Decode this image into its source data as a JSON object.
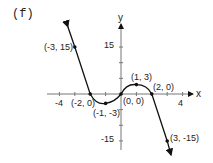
{
  "panel_label": "(f)",
  "chart_data": {
    "type": "line",
    "title": "(f)",
    "xlabel": "x",
    "ylabel": "y",
    "xlim": [
      -4.5,
      5
    ],
    "ylim": [
      -17,
      22
    ],
    "x_ticks": [
      -4,
      -3,
      -2,
      -1,
      0,
      1,
      2,
      3,
      4
    ],
    "x_tick_labels": {
      "-4": "-4",
      "4": "4"
    },
    "y_ticks": [
      -15,
      -10,
      -5,
      0,
      5,
      10,
      15
    ],
    "y_tick_labels": {
      "15": "15",
      "-15": "-15"
    },
    "grid": false,
    "legend": null,
    "series": [
      {
        "name": "f(x)",
        "points": [
          [
            -3,
            15
          ],
          [
            -2,
            0
          ],
          [
            -1,
            -3
          ],
          [
            0,
            0
          ],
          [
            1,
            3
          ],
          [
            2,
            0
          ],
          [
            3,
            -15
          ]
        ],
        "arrows_at_ends": true
      }
    ],
    "annotations": [
      {
        "text": "(-3, 15)",
        "x": -3,
        "y": 15
      },
      {
        "text": "(-2, 0)",
        "x": -2,
        "y": 0
      },
      {
        "text": "(-1, -3)",
        "x": -1,
        "y": -3
      },
      {
        "text": "(0, 0)",
        "x": 0,
        "y": 0
      },
      {
        "text": "(1, 3)",
        "x": 1,
        "y": 3
      },
      {
        "text": "(2, 0)",
        "x": 2,
        "y": 0
      },
      {
        "text": "(3, -15)",
        "x": 3,
        "y": -15
      }
    ]
  }
}
